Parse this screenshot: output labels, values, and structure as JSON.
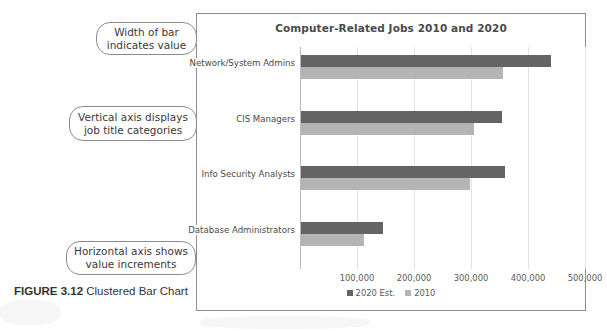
{
  "figure": {
    "label": "FIGURE 3.12",
    "caption": " Clustered Bar Chart"
  },
  "callouts": [
    {
      "name": "width-of-bar",
      "line1": "Width of bar",
      "line2": "indicates value"
    },
    {
      "name": "vertical-axis",
      "line1": "Vertical axis displays",
      "line2": "job title categories"
    },
    {
      "name": "horizontal-axis",
      "line1": "Horizontal axis shows",
      "line2": "value increments"
    }
  ],
  "chart_data": {
    "type": "bar",
    "orientation": "horizontal",
    "title": "Computer-Related Jobs 2010 and 2020",
    "xlabel": "",
    "ylabel": "",
    "categories": [
      "Network/System Admins",
      "CIS Managers",
      "Info Security Analysts",
      "Database Administrators"
    ],
    "series": [
      {
        "name": "2020 Est.",
        "color": "#646464",
        "values": [
          440000,
          355000,
          360000,
          145000
        ]
      },
      {
        "name": "2010",
        "color": "#b4b4b4",
        "values": [
          357000,
          305000,
          298000,
          112000
        ]
      }
    ],
    "xlim": [
      0,
      500000
    ],
    "xticks": [
      100000,
      200000,
      300000,
      400000,
      500000
    ],
    "xtick_labels": [
      "100,000",
      "200,000",
      "300,000",
      "400,000",
      "500,000"
    ],
    "grid": true,
    "legend_position": "bottom"
  }
}
